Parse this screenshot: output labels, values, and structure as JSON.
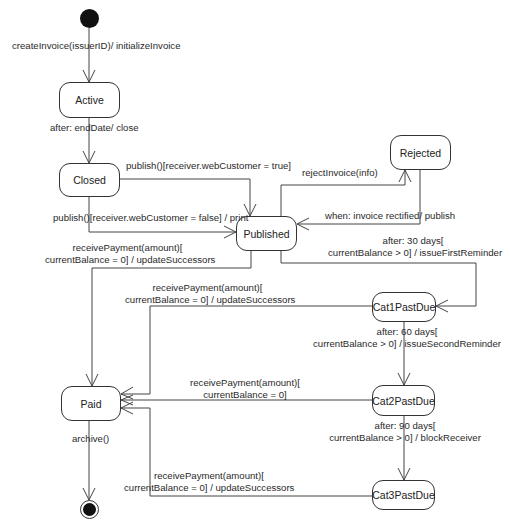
{
  "diagram": {
    "type": "uml-state-machine",
    "colors": {
      "stroke": "#333333",
      "fill": "#ffffff",
      "text": "#222222",
      "pseudostate": "#111111"
    },
    "states": [
      {
        "id": "active",
        "label": "Active"
      },
      {
        "id": "closed",
        "label": "Closed"
      },
      {
        "id": "published",
        "label": "Published"
      },
      {
        "id": "rejected",
        "label": "Rejected"
      },
      {
        "id": "cat1",
        "label": "Cat1PastDue"
      },
      {
        "id": "paid",
        "label": "Paid"
      },
      {
        "id": "cat2",
        "label": "Cat2PastDue"
      },
      {
        "id": "cat3",
        "label": "Cat3PastDue"
      }
    ],
    "transitions": {
      "initial_to_active": "createInvoice(issuerID)/ initializeInvoice",
      "active_to_closed": "after: endDate/ close",
      "closed_to_published_true": "publish()[receiver.webCustomer = true]",
      "closed_to_published_false": "publish()[receiver.webCustomer = false] / print",
      "published_to_rejected": "rejectInvoice(info)",
      "rejected_to_published": "when: invoice rectified/ publish",
      "published_to_cat1_line1": "after: 30 days[",
      "published_to_cat1_line2": "currentBalance > 0] / issueFirstReminder",
      "published_to_paid_line1": "receivePayment(amount)[",
      "published_to_paid_line2": "currentBalance = 0] / updateSuccessors",
      "cat1_to_paid_line1": "receivePayment(amount)[",
      "cat1_to_paid_line2": "currentBalance = 0] / updateSuccessors",
      "cat1_to_cat2_line1": "after: 60 days[",
      "cat1_to_cat2_line2": "currentBalance > 0] / issueSecondReminder",
      "cat2_to_paid_line1": "receivePayment(amount)[",
      "cat2_to_paid_line2": "currentBalance = 0]",
      "cat2_to_cat3_line1": "after: 90 days[",
      "cat2_to_cat3_line2": "currentBalance > 0] / blockReceiver",
      "cat3_to_paid_line1": "receivePayment(amount)[",
      "cat3_to_paid_line2": "currentBalance = 0] / updateSuccessors",
      "paid_to_final": "archive()"
    }
  }
}
